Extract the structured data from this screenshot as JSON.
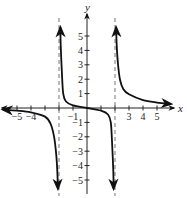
{
  "chart_data": {
    "type": "line",
    "title": "",
    "xlabel": "x",
    "ylabel": "y",
    "xlim": [
      -6,
      6
    ],
    "ylim": [
      -6,
      6
    ],
    "grid": false,
    "x_ticks": [
      -5,
      -4,
      -3,
      -2,
      -1,
      1,
      2,
      3,
      4,
      5
    ],
    "y_ticks": [
      -5,
      -4,
      -3,
      -2,
      -1,
      1,
      2,
      3,
      4,
      5
    ],
    "x_tick_labels": [
      {
        "value": -5,
        "label": "−5"
      },
      {
        "value": -4,
        "label": "−4"
      },
      {
        "value": -1,
        "label": "−1"
      },
      {
        "value": 3,
        "label": "3"
      },
      {
        "value": 4,
        "label": "4"
      },
      {
        "value": 5,
        "label": "5"
      }
    ],
    "y_tick_labels": [
      {
        "value": 5,
        "label": "5"
      },
      {
        "value": 4,
        "label": "4"
      },
      {
        "value": 3,
        "label": "3"
      },
      {
        "value": 2,
        "label": "2"
      },
      {
        "value": 1,
        "label": "1"
      },
      {
        "value": -1,
        "label": "−1"
      },
      {
        "value": -2,
        "label": "−2"
      },
      {
        "value": -3,
        "label": "−3"
      },
      {
        "value": -4,
        "label": "−4"
      },
      {
        "value": -5,
        "label": "−5"
      }
    ],
    "vertical_asymptotes": [
      -2,
      2
    ],
    "horizontal_asymptote": 0,
    "series": [
      {
        "name": "left-branch",
        "points": [
          [
            -6.0,
            -0.12
          ],
          [
            -5.0,
            -0.18
          ],
          [
            -4.0,
            -0.3
          ],
          [
            -3.0,
            -0.6
          ],
          [
            -2.6,
            -1.1
          ],
          [
            -2.35,
            -2.0
          ],
          [
            -2.2,
            -3.2
          ],
          [
            -2.12,
            -4.4
          ],
          [
            -2.08,
            -5.6
          ]
        ]
      },
      {
        "name": "middle-branch",
        "points": [
          [
            -1.9,
            5.6
          ],
          [
            -1.88,
            4.4
          ],
          [
            -1.8,
            2.6
          ],
          [
            -1.7,
            1.0
          ],
          [
            -1.5,
            0.45
          ],
          [
            -1.0,
            0.18
          ],
          [
            0.0,
            0.0
          ],
          [
            1.0,
            -0.18
          ],
          [
            1.5,
            -0.45
          ],
          [
            1.7,
            -1.0
          ],
          [
            1.8,
            -2.6
          ],
          [
            1.88,
            -4.4
          ],
          [
            1.9,
            -5.6
          ]
        ]
      },
      {
        "name": "right-branch",
        "points": [
          [
            2.08,
            5.6
          ],
          [
            2.12,
            4.4
          ],
          [
            2.2,
            3.2
          ],
          [
            2.35,
            2.0
          ],
          [
            2.6,
            1.3
          ],
          [
            3.0,
            0.95
          ],
          [
            4.0,
            0.55
          ],
          [
            5.0,
            0.38
          ],
          [
            6.0,
            0.28
          ]
        ]
      }
    ]
  },
  "colors": {
    "axis": "#222222",
    "curve": "#111111",
    "asymptote": "#666666",
    "background": "#ffffff"
  }
}
